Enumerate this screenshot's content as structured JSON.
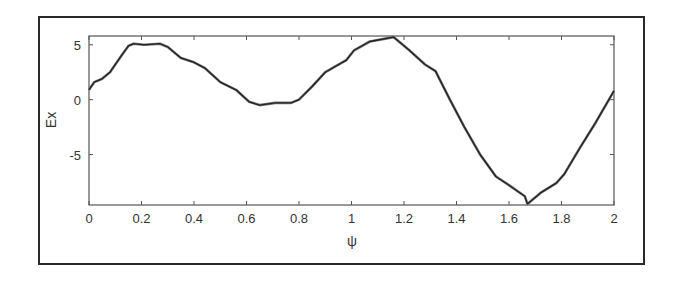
{
  "chart_data": {
    "type": "line",
    "title": "",
    "xlabel": "ψ",
    "ylabel": "Ex",
    "xlim": [
      0,
      2
    ],
    "ylim": [
      -9.6,
      5.8
    ],
    "xticks": [
      0,
      0.2,
      0.4,
      0.6,
      0.8,
      1,
      1.2,
      1.4,
      1.6,
      1.8,
      2
    ],
    "xtick_labels": [
      "0",
      "0.2",
      "0.4",
      "0.6",
      "0.8",
      "1",
      "1.2",
      "1.4",
      "1.6",
      "1.8",
      "2"
    ],
    "yticks": [
      5,
      0,
      -5
    ],
    "ytick_labels": [
      "5",
      "0",
      "-5"
    ],
    "grid": false,
    "legend": null,
    "series": [
      {
        "name": "Ex",
        "x": [
          0,
          0.02,
          0.05,
          0.08,
          0.12,
          0.15,
          0.17,
          0.21,
          0.27,
          0.3,
          0.35,
          0.4,
          0.44,
          0.5,
          0.56,
          0.61,
          0.65,
          0.71,
          0.77,
          0.8,
          0.85,
          0.9,
          0.98,
          1.01,
          1.07,
          1.16,
          1.22,
          1.28,
          1.32,
          1.375,
          1.43,
          1.49,
          1.55,
          1.6,
          1.66,
          1.67,
          1.72,
          1.78,
          1.81,
          1.87,
          1.93,
          2.0
        ],
        "y": [
          0.9,
          1.6,
          1.9,
          2.5,
          3.9,
          4.9,
          5.1,
          5.0,
          5.1,
          4.8,
          3.8,
          3.4,
          2.9,
          1.6,
          0.9,
          -0.2,
          -0.5,
          -0.3,
          -0.3,
          0.0,
          1.2,
          2.5,
          3.6,
          4.5,
          5.3,
          5.7,
          4.5,
          3.2,
          2.6,
          0.0,
          -2.5,
          -5.0,
          -7.0,
          -7.8,
          -8.8,
          -9.5,
          -8.5,
          -7.6,
          -6.8,
          -4.4,
          -2.1,
          0.8
        ]
      }
    ],
    "colors": {
      "line": "#222222",
      "axes": "#555555",
      "frame": "#2a2a2a"
    }
  }
}
